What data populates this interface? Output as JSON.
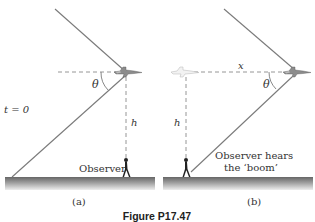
{
  "figure": {
    "caption": "Figure P17.47",
    "panels": [
      {
        "id": "a",
        "label": "(a)",
        "time_label": "t = 0",
        "angle_label": "θ",
        "height_label": "h",
        "observer_label": "Observer"
      },
      {
        "id": "b",
        "label": "(b)",
        "distance_label": "x",
        "angle_label": "θ",
        "height_label": "h",
        "observer_label_line1": "Observer hears",
        "observer_label_line2": "the ‘boom’"
      }
    ]
  },
  "colors": {
    "line": "#7a7a7a",
    "dash": "#8a8a8a",
    "ground_top": "#6e6e6e",
    "ground_bottom": "#e6e6e6",
    "text": "#333333",
    "jet": "#8c8c8c",
    "ghost_jet": "#c8c8c8"
  }
}
